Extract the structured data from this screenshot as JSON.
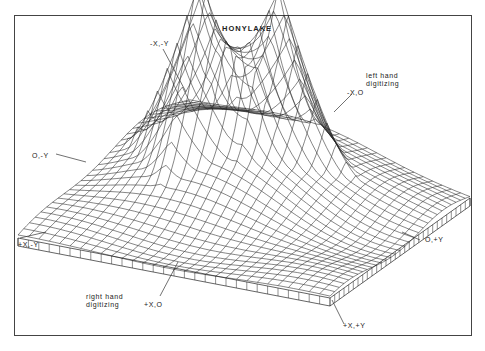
{
  "title": "HONYLAKE",
  "labels": {
    "neg_x_neg_y": "-X,-Y",
    "neg_x_0": "-X,O",
    "zero_neg_y": "O,-Y",
    "pos_x_neg_y": "+X,-Y",
    "zero_pos_y": "O,+Y",
    "pos_x_0": "+X,O",
    "pos_x_pos_y": "+X,+Y",
    "left_hand": "left hand\ndigitizing",
    "right_hand": "right hand\ndigitizing"
  },
  "surface": {
    "grid_n": 30,
    "peaks": [
      {
        "u": 0.42,
        "v": 0.28,
        "h": 1.0,
        "s": 0.085
      },
      {
        "u": 0.27,
        "v": 0.47,
        "h": 0.95,
        "s": 0.09
      }
    ],
    "corners": {
      "back": [
        190,
        105
      ],
      "left": [
        18,
        238
      ],
      "front": [
        330,
        298
      ],
      "right": [
        470,
        198
      ]
    },
    "height_px": 150,
    "base_thickness_px": 8
  }
}
